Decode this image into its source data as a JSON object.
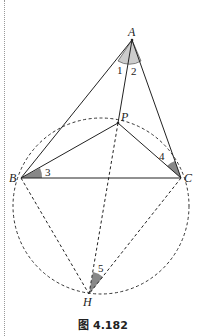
{
  "figure": {
    "caption": "图 4.182",
    "points": {
      "A": {
        "label": "A",
        "x": 132,
        "y": 40
      },
      "P": {
        "label": "P",
        "x": 118,
        "y": 123
      },
      "B": {
        "label": "B",
        "x": 21,
        "y": 178
      },
      "C": {
        "label": "C",
        "x": 181,
        "y": 178
      },
      "H": {
        "label": "H",
        "x": 89,
        "y": 294
      }
    },
    "angles": {
      "a1": "1",
      "a2": "2",
      "a3": "3",
      "a4": "4",
      "a5": "5"
    },
    "circle": {
      "cx": 101,
      "cy": 206,
      "r": 88,
      "style": "dashed"
    },
    "solid_segments": [
      "AB",
      "AC",
      "AP",
      "PB",
      "PC",
      "BC"
    ],
    "dashed_segments": [
      "PH",
      "BH",
      "CH"
    ]
  }
}
